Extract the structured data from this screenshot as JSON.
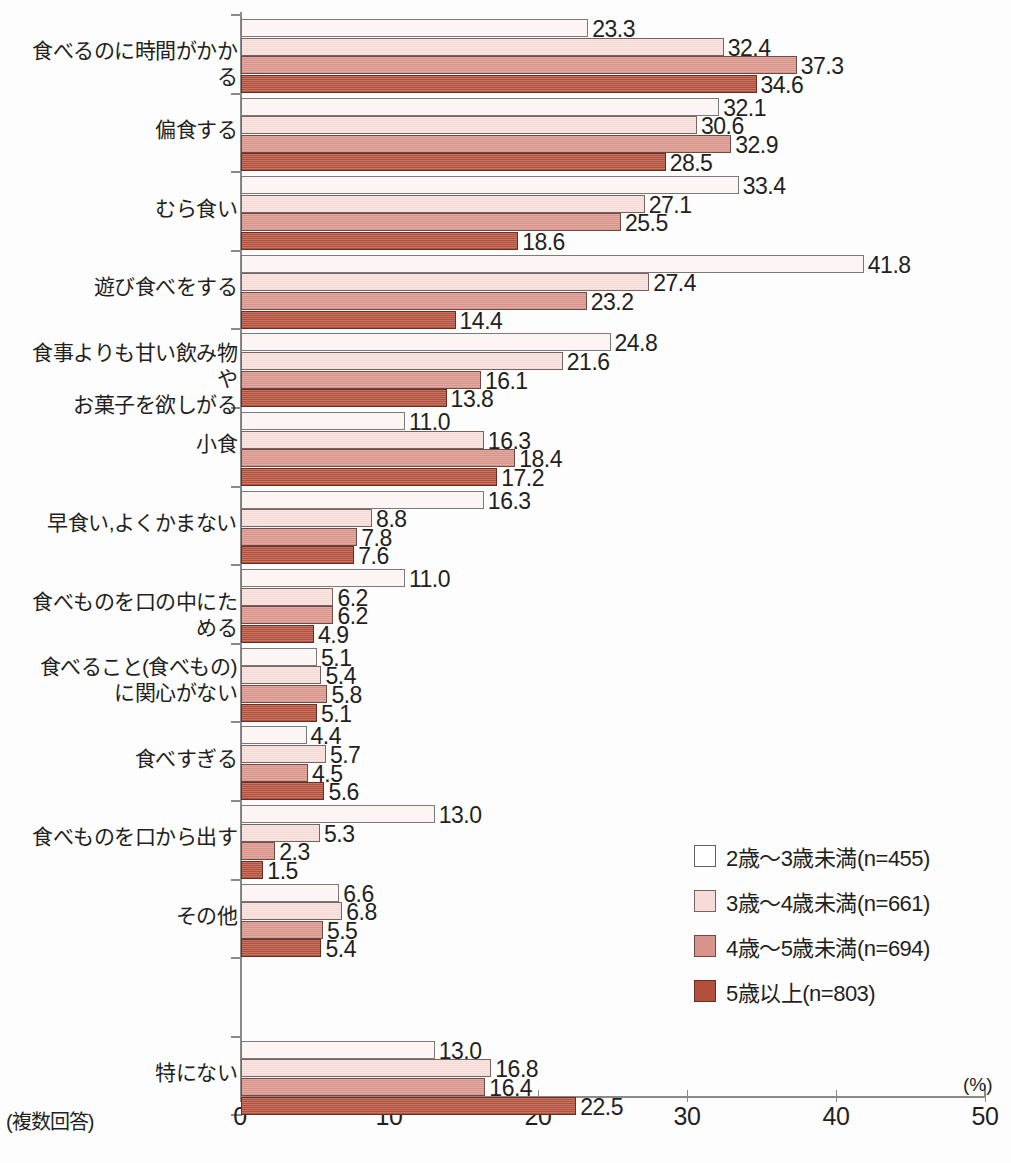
{
  "chart_data": {
    "type": "bar",
    "orientation": "horizontal",
    "title": "",
    "xlabel": "(%)",
    "ylabel": "",
    "xlim": [
      0,
      50
    ],
    "xticks": [
      0,
      10,
      20,
      30,
      40,
      50
    ],
    "grid": false,
    "legend_position": "inside-right-lower",
    "note": "(複数回答)",
    "unit": "(%)",
    "categories": [
      "食べるのに時間がかかる",
      "偏食する",
      "むら食い",
      "遊び食べをする",
      "食事よりも甘い飲み物や\nお菓子を欲しがる",
      "小食",
      "早食い,よくかまない",
      "食べものを口の中にためる",
      "食べること(食べもの)\nに関心がない",
      "食べすぎる",
      "食べものを口から出す",
      "その他",
      "",
      "特にない"
    ],
    "series": [
      {
        "name": "2歳〜3歳未満(n=455)",
        "color": "#ffffff",
        "values": [
          23.3,
          32.1,
          33.4,
          41.8,
          24.8,
          11.0,
          16.3,
          11.0,
          5.1,
          4.4,
          13.0,
          6.6,
          null,
          13.0
        ]
      },
      {
        "name": "3歳〜4歳未満(n=661)",
        "color": "#f6dcd8",
        "values": [
          32.4,
          30.6,
          27.1,
          27.4,
          21.6,
          16.3,
          8.8,
          6.2,
          5.4,
          5.7,
          5.3,
          6.8,
          null,
          16.8
        ]
      },
      {
        "name": "4歳〜5歳未満(n=694)",
        "color": "#d8948a",
        "values": [
          37.3,
          32.9,
          25.5,
          23.2,
          16.1,
          18.4,
          7.8,
          6.2,
          5.8,
          4.5,
          2.3,
          5.5,
          null,
          16.4
        ]
      },
      {
        "name": "5歳以上(n=803)",
        "color": "#b3503c",
        "values": [
          34.6,
          28.5,
          18.6,
          14.4,
          13.8,
          17.2,
          7.6,
          4.9,
          5.1,
          5.6,
          1.5,
          5.4,
          null,
          22.5
        ]
      }
    ]
  },
  "legend": {
    "items": [
      {
        "label": "2歳〜3歳未満(n=455)",
        "swatch": "s0"
      },
      {
        "label": "3歳〜4歳未満(n=661)",
        "swatch": "s1"
      },
      {
        "label": "4歳〜5歳未満(n=694)",
        "swatch": "s2"
      },
      {
        "label": "5歳以上(n=803)",
        "swatch": "s3"
      }
    ]
  },
  "axis": {
    "tick_labels": [
      "0",
      "10",
      "20",
      "30",
      "40",
      "50"
    ],
    "unit_label": "(%)"
  },
  "footer": {
    "multiple_answer_note": "(複数回答)"
  }
}
